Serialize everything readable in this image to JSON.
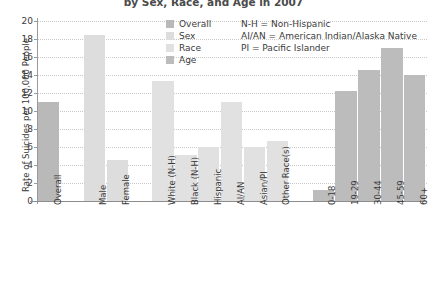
{
  "chart_data": {
    "type": "bar",
    "title": "by Sex, Race, and Age in 2007",
    "xlabel": "",
    "ylabel": "Rate of Suicides per 100,000 People",
    "ylim": [
      0,
      20
    ],
    "ytick_values": [
      20,
      18,
      16,
      14,
      12,
      10,
      8,
      6,
      4,
      2,
      0
    ],
    "ytick_labels": [
      "20",
      "18",
      "16",
      "14",
      "12",
      "10",
      "8",
      "6",
      "4",
      "2",
      "0"
    ],
    "grid": true,
    "grid_style": "dotted",
    "legend_position": "top-center",
    "categories": [
      "Overall",
      "Male",
      "Female",
      "White (N-H)",
      "Black (N-H)",
      "Hispanic",
      "AI/AN",
      "Asian/PI",
      "Other Race(s)",
      "0-18",
      "19-29",
      "30-44",
      "45-59",
      "60+"
    ],
    "values": [
      11.0,
      18.5,
      4.6,
      13.3,
      5.1,
      6.0,
      11.0,
      6.0,
      6.7,
      1.2,
      12.2,
      14.6,
      17.0,
      14.0
    ],
    "groups": [
      "Overall",
      "Sex",
      "Sex",
      "Race",
      "Race",
      "Race",
      "Race",
      "Race",
      "Race",
      "Age",
      "Age",
      "Age",
      "Age",
      "Age"
    ],
    "series": [
      {
        "name": "Overall",
        "color": "#b9b9b9",
        "points": [
          {
            "category": "Overall",
            "value": 11.0
          }
        ]
      },
      {
        "name": "Sex",
        "color": "#dddddd",
        "points": [
          {
            "category": "Male",
            "value": 18.5
          },
          {
            "category": "Female",
            "value": 4.6
          }
        ]
      },
      {
        "name": "Race",
        "color": "#e1e1e1",
        "points": [
          {
            "category": "White (N-H)",
            "value": 13.3
          },
          {
            "category": "Black (N-H)",
            "value": 5.1
          },
          {
            "category": "Hispanic",
            "value": 6.0
          },
          {
            "category": "AI/AN",
            "value": 11.0
          },
          {
            "category": "Asian/PI",
            "value": 6.0
          },
          {
            "category": "Other Race(s)",
            "value": 6.7
          }
        ]
      },
      {
        "name": "Age",
        "color": "#bcbcbc",
        "points": [
          {
            "category": "0-18",
            "value": 1.2
          },
          {
            "category": "19-29",
            "value": 12.2
          },
          {
            "category": "30-44",
            "value": 14.6
          },
          {
            "category": "45-59",
            "value": 17.0
          },
          {
            "category": "60+",
            "value": 14.0
          }
        ]
      }
    ],
    "annotations": [
      "N-H = Non-Hispanic",
      "AI/AN = American Indian/Alaska Native",
      "PI = Pacific Islander"
    ]
  },
  "legend": {
    "entries": [
      {
        "label": "Overall",
        "color": "#b9b9b9"
      },
      {
        "label": "Sex",
        "color": "#dddddd"
      },
      {
        "label": "Race",
        "color": "#e1e1e1"
      },
      {
        "label": "Age",
        "color": "#bcbcbc"
      }
    ],
    "notes": [
      "N-H = Non-Hispanic",
      "AI/AN = American Indian/Alaska Native",
      "PI = Pacific Islander"
    ]
  },
  "colors": {
    "axis": "#8d8d8d",
    "grid": "#c9c9c9",
    "text": "#3b3b3b",
    "background": "#ffffff"
  }
}
